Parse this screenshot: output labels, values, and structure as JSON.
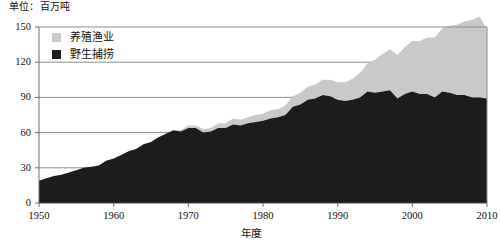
{
  "unit_note": "单位：百万吨",
  "legend": {
    "position": "top-left-inside",
    "items": [
      {
        "label": "养殖渔业",
        "color": "#c9c9c9",
        "swatch_name": "aquaculture-swatch"
      },
      {
        "label": "野生捕捞",
        "color": "#1c1c1c",
        "swatch_name": "wild-capture-swatch"
      }
    ]
  },
  "axes": {
    "x_title": "年度",
    "y_title": "",
    "y_ticks": [
      "0",
      "30",
      "60",
      "90",
      "120",
      "150"
    ],
    "x_ticks": [
      "1950",
      "1960",
      "1970",
      "1980",
      "1990",
      "2000",
      "2010"
    ]
  },
  "colors": {
    "aquaculture": "#c9c9c9",
    "wild_capture": "#1c1c1c",
    "gridline": "#8a8a8a",
    "axis": "#6f6f6f",
    "background": "#ffffff"
  },
  "chart_data": {
    "type": "area",
    "stacked": true,
    "title": "",
    "subtitle": "",
    "xlabel": "年度",
    "ylabel": "百万吨",
    "unit": "百万吨",
    "grid": true,
    "legend_position": "top-left-inside",
    "xlim": [
      1950,
      2010
    ],
    "ylim": [
      0,
      150
    ],
    "x_ticks": [
      1950,
      1960,
      1970,
      1980,
      1990,
      2000,
      2010
    ],
    "y_ticks": [
      0,
      30,
      60,
      90,
      120,
      150
    ],
    "x": [
      1950,
      1951,
      1952,
      1953,
      1954,
      1955,
      1956,
      1957,
      1958,
      1959,
      1960,
      1961,
      1962,
      1963,
      1964,
      1965,
      1966,
      1967,
      1968,
      1969,
      1970,
      1971,
      1972,
      1973,
      1974,
      1975,
      1976,
      1977,
      1978,
      1979,
      1980,
      1981,
      1982,
      1983,
      1984,
      1985,
      1986,
      1987,
      1988,
      1989,
      1990,
      1991,
      1992,
      1993,
      1994,
      1995,
      1996,
      1997,
      1998,
      1999,
      2000,
      2001,
      2002,
      2003,
      2004,
      2005,
      2006,
      2007,
      2008,
      2009,
      2010
    ],
    "series": [
      {
        "name": "野生捕捞",
        "color": "#1c1c1c",
        "values": [
          19,
          21,
          23,
          24,
          26,
          28,
          30,
          31,
          32,
          36,
          38,
          41,
          44,
          46,
          50,
          52,
          56,
          59,
          62,
          61,
          64,
          64,
          60,
          61,
          64,
          64,
          67,
          66,
          68,
          69,
          70,
          72,
          73,
          75,
          82,
          84,
          88,
          89,
          92,
          91,
          88,
          87,
          88,
          90,
          95,
          94,
          95,
          96,
          89,
          93,
          95,
          93,
          93,
          90,
          95,
          94,
          92,
          92,
          90,
          90,
          89
        ]
      },
      {
        "name": "养殖渔业",
        "color": "#c9c9c9",
        "values": [
          0,
          0,
          0,
          0,
          0,
          0,
          0,
          0,
          0,
          0,
          0,
          0,
          0,
          0,
          0,
          0,
          0,
          0,
          0,
          1,
          2,
          2,
          3,
          3,
          4,
          4,
          5,
          5,
          5,
          6,
          6,
          7,
          7,
          8,
          9,
          10,
          11,
          12,
          13,
          14,
          15,
          16,
          18,
          21,
          24,
          28,
          32,
          35,
          37,
          40,
          43,
          45,
          48,
          51,
          54,
          57,
          60,
          63,
          66,
          69,
          59
        ]
      }
    ],
    "totals": [
      19,
      21,
      23,
      24,
      26,
      28,
      30,
      31,
      32,
      36,
      38,
      41,
      44,
      46,
      50,
      52,
      56,
      59,
      62,
      62,
      66,
      66,
      63,
      64,
      68,
      68,
      72,
      71,
      73,
      75,
      76,
      79,
      80,
      83,
      91,
      94,
      99,
      101,
      105,
      105,
      103,
      103,
      106,
      111,
      119,
      122,
      127,
      131,
      126,
      133,
      138,
      138,
      141,
      141,
      149,
      151,
      152,
      155,
      156,
      159,
      148
    ]
  }
}
